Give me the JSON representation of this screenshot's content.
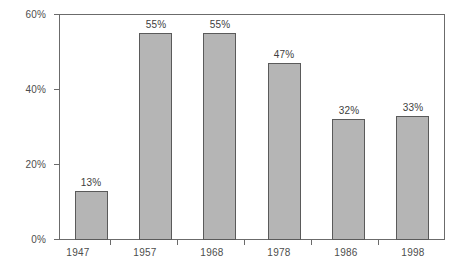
{
  "chart_data": {
    "type": "bar",
    "title": "",
    "subtitle": "",
    "xlabel": "",
    "ylabel": "",
    "categories": [
      "1947",
      "1957",
      "1968",
      "1978",
      "1986",
      "1998"
    ],
    "values": [
      13,
      55,
      55,
      47,
      32,
      33
    ],
    "value_labels": [
      "13%",
      "55%",
      "55%",
      "47%",
      "32%",
      "33%"
    ],
    "ylim": [
      0,
      60
    ],
    "ytick_values": [
      0,
      20,
      40,
      60
    ],
    "ytick_labels": [
      "0%",
      "20%",
      "40%",
      "60%"
    ],
    "grid": false,
    "legend": null,
    "legend_position": "none",
    "series": [
      {
        "name": "",
        "values": [
          13,
          55,
          55,
          47,
          32,
          33
        ]
      }
    ],
    "colors": {
      "bar_fill": "#b5b5b5",
      "bar_border": "#5a5a5a",
      "axis": "#6b6b6b",
      "text": "#4d4d4d",
      "background": "#ffffff"
    }
  }
}
